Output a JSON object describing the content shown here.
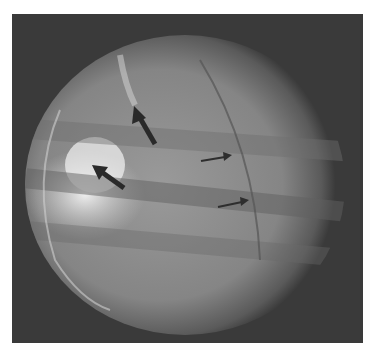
{
  "image": {
    "description": "Grayscale fluoroscopic chest image within circular field of view, with arrows indicating findings",
    "background_color": "#ffffff",
    "frame_color": "#3a3a3a",
    "arrows": [
      {
        "type": "large",
        "from": [
          155,
          144
        ],
        "to": [
          134,
          108
        ],
        "color": "#2a2a2a"
      },
      {
        "type": "large",
        "from": [
          124,
          188
        ],
        "to": [
          93,
          166
        ],
        "color": "#2a2a2a"
      },
      {
        "type": "small",
        "from": [
          201,
          161
        ],
        "to": [
          231,
          156
        ],
        "color": "#2e2e2e"
      },
      {
        "type": "small",
        "from": [
          218,
          207
        ],
        "to": [
          248,
          201
        ],
        "color": "#2e2e2e"
      }
    ]
  }
}
